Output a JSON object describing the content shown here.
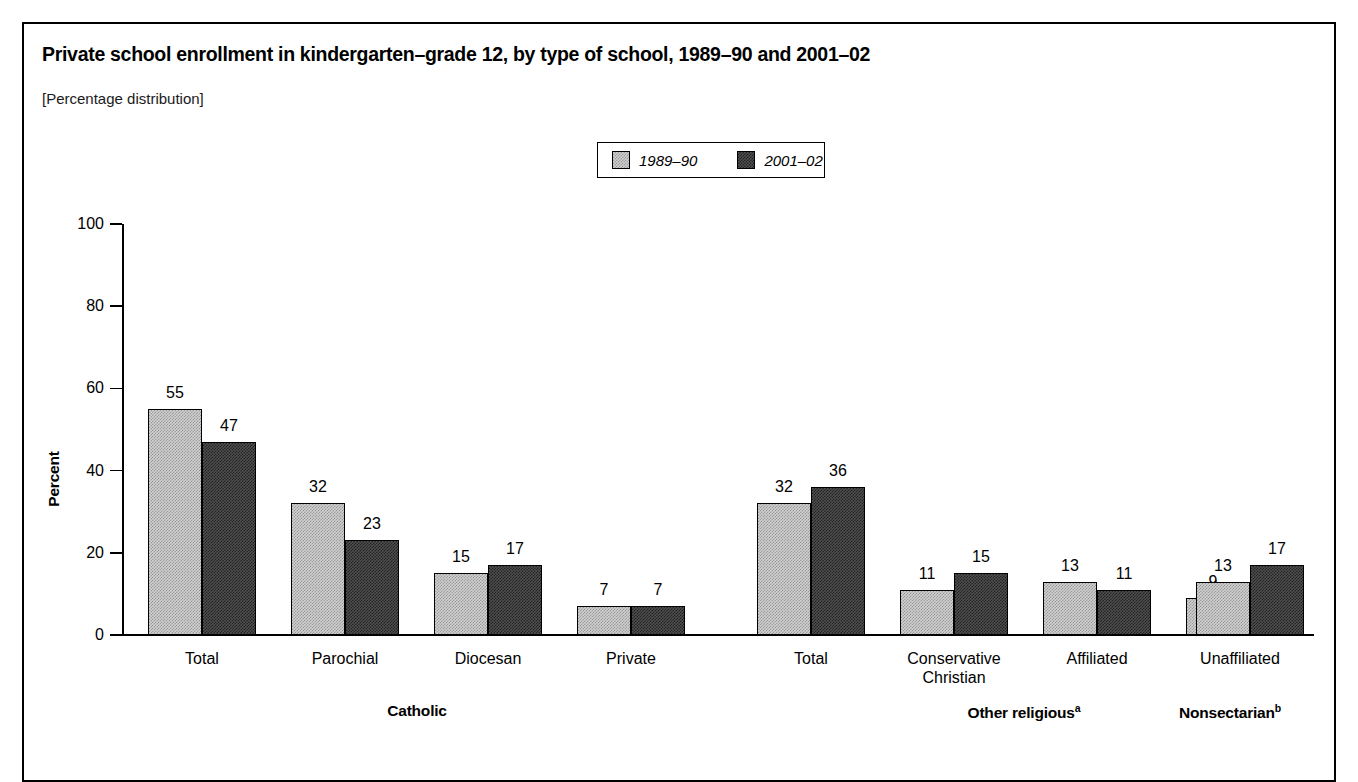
{
  "figure": {
    "title": "Private school enrollment in kindergarten–grade 12, by type of school, 1989–90 and 2001–02",
    "subtitle": "[Percentage distribution]",
    "y_axis_title": "Percent"
  },
  "legend": {
    "items": [
      {
        "label": "1989–90",
        "color": "#d0d0d0",
        "style": "light-dither"
      },
      {
        "label": "2001–02",
        "color": "#4f4f4f",
        "style": "dark-dither"
      }
    ]
  },
  "y_ticks": [
    "0",
    "20",
    "40",
    "60",
    "80",
    "100"
  ],
  "groups": [
    {
      "label": "Catholic",
      "superscript": ""
    },
    {
      "label": "Other religious",
      "superscript": "a"
    },
    {
      "label": "Nonsectarian",
      "superscript": "b"
    }
  ],
  "chart_data": {
    "type": "bar",
    "title": "Private school enrollment in kindergarten–grade 12, by type of school, 1989–90 and 2001–02",
    "subtitle": "[Percentage distribution]",
    "xlabel": "",
    "ylabel": "Percent",
    "ylim": [
      0,
      100
    ],
    "yticks": [
      0,
      20,
      40,
      60,
      80,
      100
    ],
    "grid": false,
    "legend_position": "top-center",
    "categories": [
      "Total",
      "Parochial",
      "Diocesan",
      "Private",
      "Total",
      "Conservative Christian",
      "Affiliated",
      "Unaffiliated",
      ""
    ],
    "category_lines": [
      [
        "Total"
      ],
      [
        "Parochial"
      ],
      [
        "Diocesan"
      ],
      [
        "Private"
      ],
      [
        "Total"
      ],
      [
        "Conservative",
        "Christian"
      ],
      [
        "Affiliated"
      ],
      [
        "Unaffiliated"
      ],
      [
        ""
      ]
    ],
    "category_groups": [
      "Catholic",
      "Catholic",
      "Catholic",
      "Catholic",
      "Other religious",
      "Other religious",
      "Other religious",
      "Other religious",
      "Nonsectarian"
    ],
    "series": [
      {
        "name": "1989–90",
        "color": "#d0d0d0",
        "values": [
          55,
          32,
          15,
          7,
          32,
          11,
          13,
          9,
          13
        ]
      },
      {
        "name": "2001–02",
        "color": "#4f4f4f",
        "values": [
          47,
          23,
          17,
          7,
          36,
          15,
          11,
          10,
          17
        ]
      }
    ],
    "data_labels": [
      {
        "category": "Total",
        "group": "Catholic",
        "1989-90": 55,
        "2001-02": 47
      },
      {
        "category": "Parochial",
        "group": "Catholic",
        "1989-90": 32,
        "2001-02": 23
      },
      {
        "category": "Diocesan",
        "group": "Catholic",
        "1989-90": 15,
        "2001-02": 17
      },
      {
        "category": "Private",
        "group": "Catholic",
        "1989-90": 7,
        "2001-02": 7
      },
      {
        "category": "Total",
        "group": "Other religious",
        "1989-90": 32,
        "2001-02": 36
      },
      {
        "category": "Conservative Christian",
        "group": "Other religious",
        "1989-90": 11,
        "2001-02": 15
      },
      {
        "category": "Affiliated",
        "group": "Other religious",
        "1989-90": 13,
        "2001-02": 11
      },
      {
        "category": "Unaffiliated",
        "group": "Other religious",
        "1989-90": 9,
        "2001-02": 10
      },
      {
        "category": "Nonsectarian",
        "group": "Nonsectarian",
        "1989-90": 13,
        "2001-02": 17
      }
    ]
  }
}
